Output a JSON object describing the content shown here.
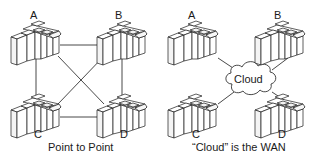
{
  "left_panel": {
    "caption": "Point to Point",
    "nodes": [
      {
        "id": "A",
        "label": "A"
      },
      {
        "id": "B",
        "label": "B"
      },
      {
        "id": "C",
        "label": "C"
      },
      {
        "id": "D",
        "label": "D"
      }
    ],
    "links": [
      [
        "A",
        "B"
      ],
      [
        "C",
        "D"
      ],
      [
        "A",
        "C"
      ],
      [
        "B",
        "D"
      ],
      [
        "A",
        "D"
      ],
      [
        "B",
        "C"
      ]
    ]
  },
  "right_panel": {
    "caption": "“Cloud” is the WAN",
    "cloud_label": "Cloud",
    "nodes": [
      {
        "id": "A",
        "label": "A"
      },
      {
        "id": "B",
        "label": "B"
      },
      {
        "id": "C",
        "label": "C"
      },
      {
        "id": "D",
        "label": "D"
      }
    ],
    "links": [
      [
        "A",
        "Cloud"
      ],
      [
        "B",
        "Cloud"
      ],
      [
        "C",
        "Cloud"
      ],
      [
        "D",
        "Cloud"
      ]
    ]
  },
  "colors": {
    "line": "#1a1a1a",
    "fill": "#ffffff",
    "shade": "#e8e8e8"
  }
}
